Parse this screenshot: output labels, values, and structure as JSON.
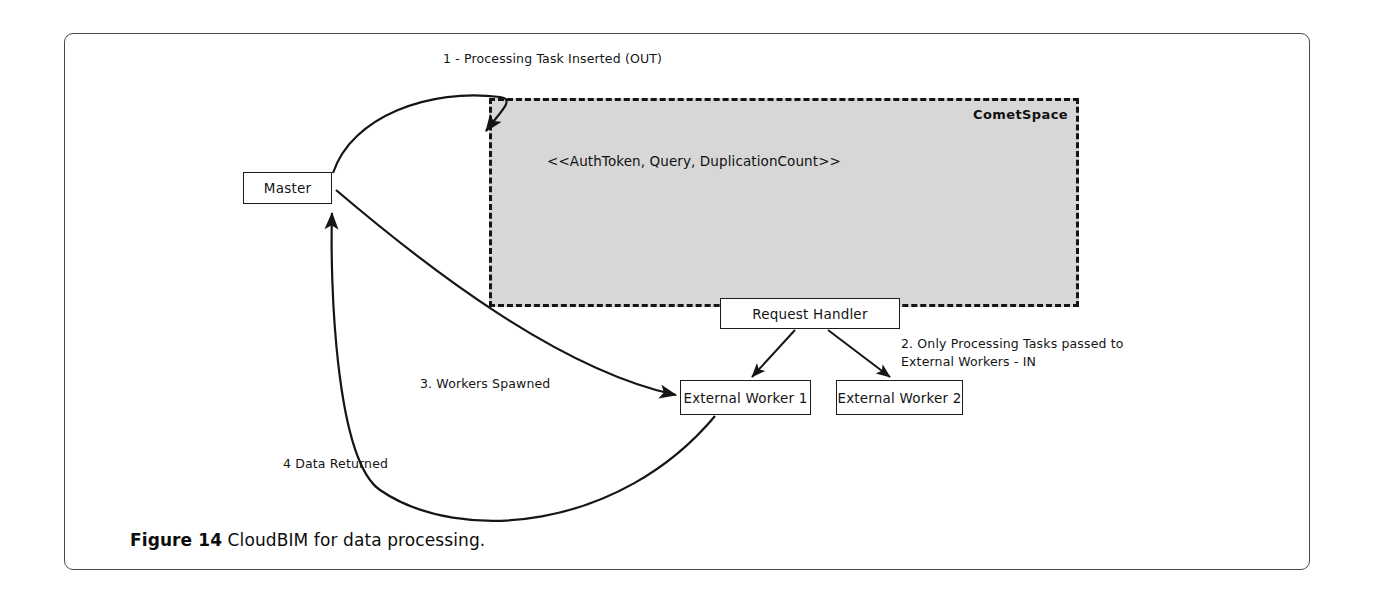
{
  "figure": {
    "caption_label": "Figure 14",
    "caption_text": " CloudBIM for data processing.",
    "border_color": "#4a4a4a"
  },
  "diagram": {
    "type": "flow-architecture",
    "region": {
      "name": "CometSpace",
      "label": "CometSpace",
      "fill_color": "#d7d7d7",
      "border_style": "dashed",
      "border_color": "#151515",
      "content_label": "<<AuthToken, Query, DuplicationCount>>"
    },
    "nodes": [
      {
        "id": "master",
        "label": "Master"
      },
      {
        "id": "request-handler",
        "label": "Request Handler"
      },
      {
        "id": "external-worker-1",
        "label": "External Worker 1"
      },
      {
        "id": "external-worker-2",
        "label": "External Worker 2"
      }
    ],
    "flows": [
      {
        "id": "step1",
        "label": "1 - Processing Task Inserted (OUT)",
        "from": "master",
        "to": "CometSpace"
      },
      {
        "id": "step2",
        "label": "2. Only Processing Tasks passed to\nExternal Workers - IN",
        "from": "CometSpace",
        "to": "request-handler"
      },
      {
        "id": "step3",
        "label": "3. Workers Spawned",
        "from": "master",
        "to": "external-worker-1"
      },
      {
        "id": "step4",
        "label": "4 Data Returned",
        "from": "external-worker-1",
        "to": "master"
      }
    ]
  }
}
